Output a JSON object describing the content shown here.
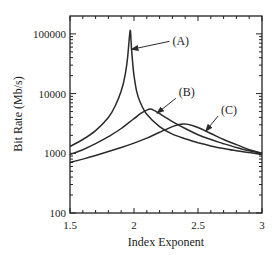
{
  "chart_data": {
    "type": "line",
    "title": "",
    "xlabel": "Index Exponent",
    "ylabel": "Bit Rate (Mb/s)",
    "xlim": [
      1.5,
      3.0
    ],
    "ylim": [
      100,
      200000
    ],
    "yscale": "log",
    "grid": false,
    "legend": "inline annotations with arrows",
    "x_ticks": [
      1.5,
      2,
      2.5,
      3
    ],
    "x_tick_labels": [
      "1.5",
      "2",
      "2.5",
      "3"
    ],
    "y_ticks": [
      100,
      1000,
      10000,
      100000
    ],
    "y_tick_labels": [
      "100",
      "1000",
      "10000",
      "100000"
    ],
    "series": [
      {
        "name": "(A)",
        "x": [
          1.5,
          1.6,
          1.7,
          1.8,
          1.85,
          1.9,
          1.93,
          1.95,
          1.97,
          1.98,
          1.99,
          2.0,
          2.02,
          2.05,
          2.1,
          2.2,
          2.3,
          2.4,
          2.5,
          2.6,
          2.7,
          2.8,
          2.9,
          3.0
        ],
        "y": [
          1300,
          1700,
          2400,
          4000,
          6000,
          11000,
          20000,
          40000,
          115000,
          60000,
          32000,
          20000,
          11000,
          7000,
          4500,
          2800,
          2100,
          1750,
          1500,
          1330,
          1200,
          1100,
          1030,
          950
        ]
      },
      {
        "name": "(B)",
        "x": [
          1.5,
          1.6,
          1.7,
          1.8,
          1.9,
          2.0,
          2.05,
          2.1,
          2.13,
          2.16,
          2.2,
          2.3,
          2.4,
          2.5,
          2.6,
          2.7,
          2.8,
          2.9,
          3.0
        ],
        "y": [
          950,
          1150,
          1450,
          1900,
          2600,
          3800,
          4600,
          5300,
          5500,
          5200,
          4600,
          3400,
          2600,
          2050,
          1700,
          1450,
          1250,
          1100,
          1000
        ]
      },
      {
        "name": "(C)",
        "x": [
          1.5,
          1.6,
          1.7,
          1.8,
          1.9,
          2.0,
          2.1,
          2.2,
          2.3,
          2.35,
          2.4,
          2.45,
          2.5,
          2.6,
          2.7,
          2.8,
          2.9,
          3.0
        ],
        "y": [
          700,
          800,
          920,
          1070,
          1250,
          1480,
          1800,
          2250,
          2800,
          3050,
          3100,
          2950,
          2700,
          2150,
          1700,
          1400,
          1150,
          1000
        ]
      }
    ],
    "annotations": [
      {
        "text": "(A)",
        "label_x": 2.3,
        "label_y": 75000,
        "arrow_to_x": 1.98,
        "arrow_to_y": 55000
      },
      {
        "text": "(B)",
        "label_x": 2.35,
        "label_y": 10500,
        "arrow_to_x": 2.18,
        "arrow_to_y": 4700
      },
      {
        "text": "(C)",
        "label_x": 2.68,
        "label_y": 5300,
        "arrow_to_x": 2.56,
        "arrow_to_y": 2350
      }
    ]
  },
  "colors": {
    "line": "#2a2a2a",
    "axis": "#222222",
    "background": "#ffffff"
  }
}
